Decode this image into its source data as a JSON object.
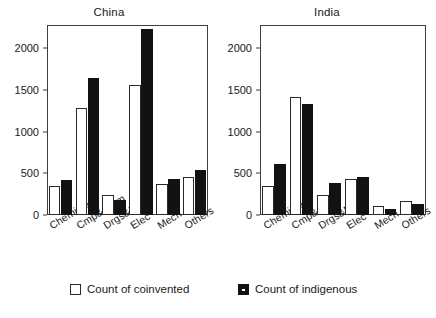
{
  "chart_data": {
    "type": "bar",
    "title": "",
    "panels": [
      {
        "title": "China",
        "categories": [
          "Chemical",
          "Cmp&Cmm",
          "Drgs&Med",
          "Elec",
          "Mech",
          "Others"
        ],
        "series": [
          {
            "name": "Count of coinvented",
            "values": [
              350,
              1290,
              240,
              1560,
              370,
              460
            ]
          },
          {
            "name": "Count of indigenous",
            "values": [
              420,
              1650,
              180,
              2230,
              430,
              545
            ]
          }
        ],
        "ylim": [
          0,
          2280
        ],
        "yticks": [
          0,
          500,
          1000,
          1500,
          2000
        ],
        "ytick_labels": [
          "0",
          "500",
          "1000",
          "1500",
          "2000"
        ],
        "xlabel": "",
        "ylabel": "",
        "grid": false
      },
      {
        "title": "India",
        "categories": [
          "Chemical",
          "Cmp&Cmm",
          "Drgs&Med",
          "Elec",
          "Mech",
          "Others"
        ],
        "series": [
          {
            "name": "Count of coinvented",
            "values": [
              350,
              1420,
              240,
              430,
              110,
              170
            ]
          },
          {
            "name": "Count of indigenous",
            "values": [
              610,
              1330,
              380,
              460,
              70,
              130
            ]
          }
        ],
        "ylim": [
          0,
          2280
        ],
        "yticks": [
          0,
          500,
          1000,
          1500,
          2000
        ],
        "ytick_labels": [
          "0",
          "500",
          "1000",
          "1500",
          "2000"
        ],
        "xlabel": "",
        "ylabel": "",
        "grid": false
      }
    ],
    "legend": {
      "position": "bottom",
      "entries": [
        {
          "label": "Count of coinvented",
          "style": "open",
          "color": "#ffffff",
          "edge": "#2a2a2a"
        },
        {
          "label": "Count of indigenous",
          "style": "filled",
          "color": "#121212",
          "edge": "#121212"
        }
      ]
    }
  },
  "colors": {
    "axis": "#3d3d3d",
    "text": "#1a1a1a",
    "coinvented_fill": "#ffffff",
    "coinvented_edge": "#2a2a2a",
    "indigenous_fill": "#121212",
    "background": "#ffffff"
  }
}
